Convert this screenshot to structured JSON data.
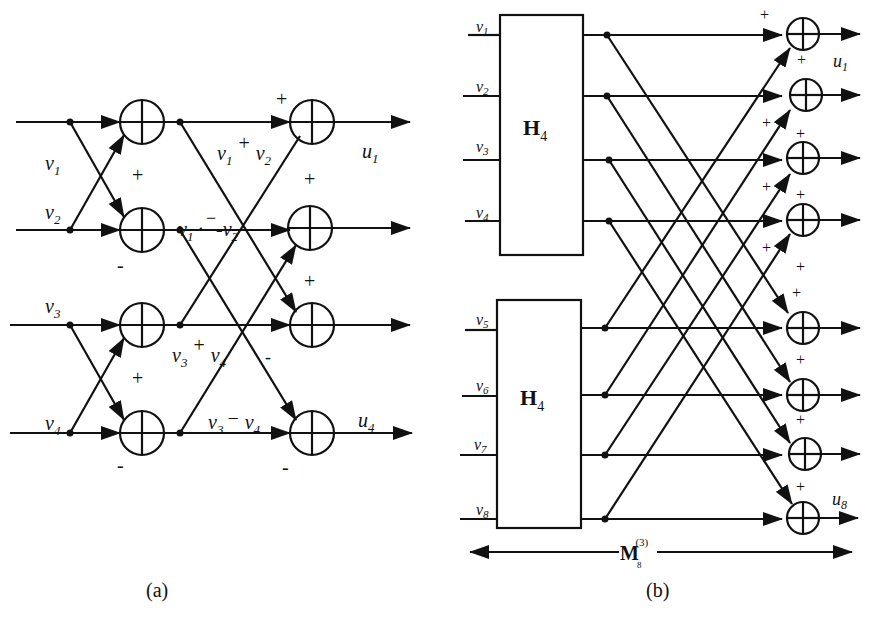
{
  "figure": {
    "panel_a": {
      "caption": "(a)",
      "inputs": [
        {
          "name": "v",
          "sub": "1"
        },
        {
          "name": "v",
          "sub": "2"
        },
        {
          "name": "v",
          "sub": "3"
        },
        {
          "name": "v",
          "sub": "4"
        }
      ],
      "intermediate_labels": {
        "sum12_a": "v",
        "sum12_a_sub": "1",
        "sum12_op": "+",
        "sum12_b": "v",
        "sum12_b_sub": "2",
        "diff12_a": "v",
        "diff12_a_sub": "1",
        "diff12_op": "·",
        "diff12_b": "-v",
        "diff12_b_sub": "2",
        "sum34_a": "v",
        "sum34_a_sub": "3",
        "sum34_op": "+",
        "sum34_b": "v",
        "sum34_b_sub": "4",
        "diff34_a": "v",
        "diff34_a_sub": "3",
        "diff34_op": "−",
        "diff34_b": "v",
        "diff34_b_sub": "4"
      },
      "outputs": [
        {
          "name": "u",
          "sub": "1"
        },
        {
          "name": "u",
          "sub": "4"
        }
      ],
      "signs": {
        "plus": "+",
        "minus": "-",
        "minus_long": "−"
      }
    },
    "panel_b": {
      "caption": "(b)",
      "blocks": [
        {
          "label": "H",
          "sub": "4"
        },
        {
          "label": "H",
          "sub": "4"
        }
      ],
      "inputs": [
        {
          "name": "v",
          "sub": "1"
        },
        {
          "name": "v",
          "sub": "2"
        },
        {
          "name": "v",
          "sub": "3"
        },
        {
          "name": "v",
          "sub": "4"
        },
        {
          "name": "v",
          "sub": "5"
        },
        {
          "name": "v",
          "sub": "6"
        },
        {
          "name": "v",
          "sub": "7"
        },
        {
          "name": "v",
          "sub": "8"
        }
      ],
      "outputs": [
        {
          "name": "u",
          "sub": "1"
        },
        {
          "name": "u",
          "sub": "8"
        }
      ],
      "plus_sign": "+",
      "span_label": {
        "name": "M",
        "sub": "8",
        "sup": "(3)"
      }
    }
  }
}
